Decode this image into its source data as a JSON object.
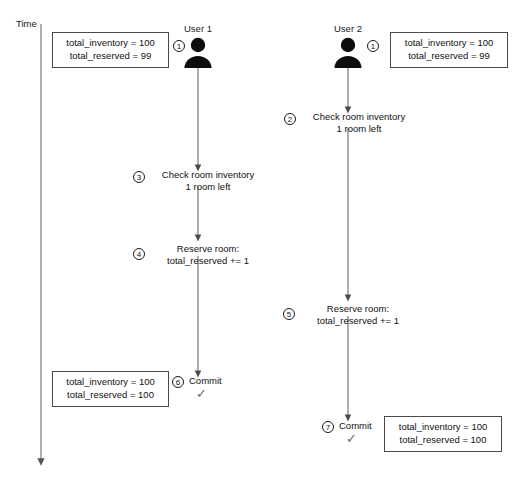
{
  "diagram": {
    "time_axis_label": "Time",
    "actors": [
      {
        "id": "user1",
        "name": "User 1",
        "badge": "1"
      },
      {
        "id": "user2",
        "name": "User 2",
        "badge": "1"
      }
    ],
    "state_boxes": [
      {
        "id": "user1-initial-state",
        "line1": "total_inventory = 100",
        "line2": "total_reserved = 99"
      },
      {
        "id": "user2-initial-state",
        "line1": "total_inventory = 100",
        "line2": "total_reserved = 99"
      },
      {
        "id": "user1-final-state",
        "line1": "total_inventory = 100",
        "line2": "total_reserved = 100"
      },
      {
        "id": "user2-final-state",
        "line1": "total_inventory = 100",
        "line2": "total_reserved = 100"
      }
    ],
    "steps": [
      {
        "num": "2",
        "lane": "user2",
        "line1": "Check room inventory",
        "line2": "1 room left"
      },
      {
        "num": "3",
        "lane": "user1",
        "line1": "Check room inventory",
        "line2": "1 room left"
      },
      {
        "num": "4",
        "lane": "user1",
        "line1": "Reserve room:",
        "line2": "total_reserved += 1"
      },
      {
        "num": "5",
        "lane": "user2",
        "line1": "Reserve room:",
        "line2": "total_reserved += 1"
      },
      {
        "num": "6",
        "lane": "user1",
        "line1": "Commit",
        "line2": "",
        "check": "✓"
      },
      {
        "num": "7",
        "lane": "user2",
        "line1": "Commit",
        "line2": "",
        "check": "✓"
      }
    ],
    "colors": {
      "line": "#6b6b6b",
      "ink": "#1a1a1a",
      "box_border": "#4a4a4a",
      "check": "#6b6b6b"
    }
  }
}
